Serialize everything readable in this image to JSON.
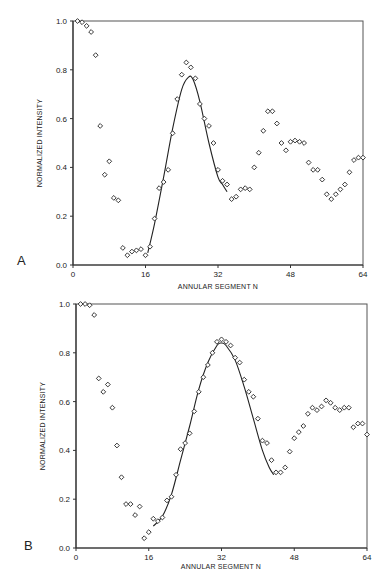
{
  "chart_data": [
    {
      "panel": "A",
      "type": "scatter",
      "title": "",
      "xlabel": "ANNULAR SEGMENT N",
      "ylabel": "NORMALIZED INTENSITY",
      "xlim": [
        0,
        64
      ],
      "ylim": [
        0.0,
        1.0
      ],
      "xticks": [
        "0",
        "16",
        "32",
        "48",
        "64"
      ],
      "yticks": [
        "0.0",
        "0.2",
        "0.4",
        "0.6",
        "0.8",
        "1.0"
      ],
      "grid": false,
      "legend": null,
      "series": [
        {
          "name": "measured",
          "marker": "diamond",
          "x": [
            1,
            2,
            3,
            4,
            5,
            6,
            7,
            8,
            9,
            10,
            11,
            12,
            13,
            14,
            15,
            16,
            17,
            18,
            19,
            20,
            21,
            22,
            23,
            24,
            25,
            26,
            27,
            28,
            29,
            30,
            31,
            32,
            33,
            34,
            35,
            36,
            37,
            38,
            39,
            40,
            41,
            42,
            43,
            44,
            45,
            46,
            47,
            48,
            49,
            50,
            51,
            52,
            53,
            54,
            55,
            56,
            57,
            58,
            59,
            60,
            61,
            62,
            63,
            64
          ],
          "y": [
            1.0,
            0.995,
            0.98,
            0.955,
            0.86,
            0.57,
            0.37,
            0.425,
            0.275,
            0.265,
            0.07,
            0.04,
            0.055,
            0.06,
            0.065,
            0.04,
            0.075,
            0.19,
            0.315,
            0.34,
            0.39,
            0.54,
            0.68,
            0.78,
            0.83,
            0.81,
            0.765,
            0.66,
            0.6,
            0.57,
            0.5,
            0.39,
            0.345,
            0.33,
            0.27,
            0.28,
            0.31,
            0.315,
            0.31,
            0.4,
            0.46,
            0.55,
            0.63,
            0.63,
            0.58,
            0.5,
            0.47,
            0.505,
            0.51,
            0.505,
            0.5,
            0.42,
            0.39,
            0.39,
            0.35,
            0.29,
            0.27,
            0.29,
            0.31,
            0.33,
            0.38,
            0.43,
            0.44,
            0.44
          ]
        },
        {
          "name": "fit",
          "marker": "line",
          "x": [
            16.5,
            18,
            20,
            22,
            24,
            25.5,
            26.5,
            28,
            30,
            32,
            33,
            34
          ],
          "y": [
            0.05,
            0.17,
            0.36,
            0.56,
            0.72,
            0.77,
            0.76,
            0.67,
            0.5,
            0.36,
            0.33,
            0.3
          ]
        }
      ]
    },
    {
      "panel": "B",
      "type": "scatter",
      "title": "",
      "xlabel": "ANNULAR SEGMENT N",
      "ylabel": "NORMALIZED INTENSITY",
      "xlim": [
        0,
        64
      ],
      "ylim": [
        0.0,
        1.0
      ],
      "xticks": [
        "0",
        "16",
        "32",
        "48",
        "64"
      ],
      "yticks": [
        "0.0",
        "0.2",
        "0.4",
        "0.6",
        "0.8",
        "1.0"
      ],
      "grid": false,
      "legend": null,
      "series": [
        {
          "name": "measured",
          "marker": "diamond",
          "x": [
            1,
            2,
            3,
            4,
            5,
            6,
            7,
            8,
            9,
            10,
            11,
            12,
            13,
            14,
            15,
            16,
            17,
            18,
            19,
            20,
            21,
            22,
            23,
            24,
            25,
            26,
            27,
            28,
            29,
            30,
            31,
            32,
            33,
            34,
            35,
            36,
            37,
            38,
            39,
            40,
            41,
            42,
            43,
            44,
            45,
            46,
            47,
            48,
            49,
            50,
            51,
            52,
            53,
            54,
            55,
            56,
            57,
            58,
            59,
            60,
            61,
            62,
            63,
            64
          ],
          "y": [
            1.0,
            1.0,
            0.995,
            0.955,
            0.695,
            0.64,
            0.67,
            0.575,
            0.42,
            0.29,
            0.18,
            0.18,
            0.135,
            0.17,
            0.04,
            0.065,
            0.12,
            0.11,
            0.125,
            0.195,
            0.21,
            0.3,
            0.405,
            0.43,
            0.47,
            0.56,
            0.64,
            0.7,
            0.75,
            0.8,
            0.845,
            0.855,
            0.845,
            0.83,
            0.78,
            0.76,
            0.69,
            0.64,
            0.62,
            0.53,
            0.44,
            0.43,
            0.36,
            0.31,
            0.31,
            0.33,
            0.395,
            0.45,
            0.475,
            0.5,
            0.55,
            0.575,
            0.565,
            0.58,
            0.605,
            0.595,
            0.575,
            0.565,
            0.575,
            0.575,
            0.495,
            0.51,
            0.51,
            0.465
          ]
        },
        {
          "name": "fit",
          "marker": "line",
          "x": [
            17,
            19,
            21,
            23,
            25,
            27,
            29,
            31,
            32,
            33,
            35,
            37,
            39,
            41,
            42.5,
            43.5
          ],
          "y": [
            0.09,
            0.13,
            0.22,
            0.36,
            0.5,
            0.65,
            0.76,
            0.83,
            0.84,
            0.83,
            0.77,
            0.66,
            0.53,
            0.4,
            0.33,
            0.3
          ]
        }
      ]
    }
  ],
  "panels": [
    {
      "label": "A",
      "xlabel": "ANNULAR SEGMENT N",
      "ylabel": "NORMALIZED INTENSITY"
    },
    {
      "label": "B",
      "xlabel": "ANNULAR SEGMENT N",
      "ylabel": "NORMALIZED INTENSITY"
    }
  ]
}
